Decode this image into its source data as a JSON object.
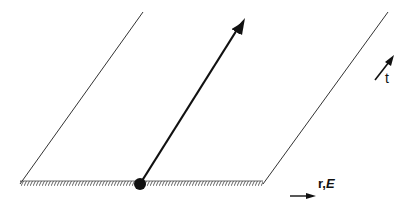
{
  "diagram": {
    "type": "spacetime-diagram",
    "elements": {
      "left_boundary_line": {
        "from": [
          20,
          184
        ],
        "to": [
          143,
          12
        ]
      },
      "right_boundary_line": {
        "from": [
          263,
          184
        ],
        "to": [
          388,
          12
        ]
      },
      "base_line": {
        "from": [
          20,
          184
        ],
        "to": [
          263,
          184
        ],
        "style": "hatched"
      },
      "world_line_arrow": {
        "from": [
          140,
          184
        ],
        "to": [
          243,
          20
        ]
      },
      "event_point": {
        "cx": 140,
        "cy": 184,
        "r": 6
      },
      "r_axis_arrow": {
        "from": [
          290,
          196
        ],
        "to": [
          314,
          196
        ]
      },
      "t_axis_arrow": {
        "from": [
          375,
          80
        ],
        "to": [
          392,
          58
        ]
      }
    },
    "labels": {
      "r_axis_prefix": "r,",
      "r_axis_italic": "E",
      "t_axis": "t"
    },
    "colors": {
      "line": "#222222",
      "thin_line": "#333333",
      "hatch": "#555555"
    }
  }
}
